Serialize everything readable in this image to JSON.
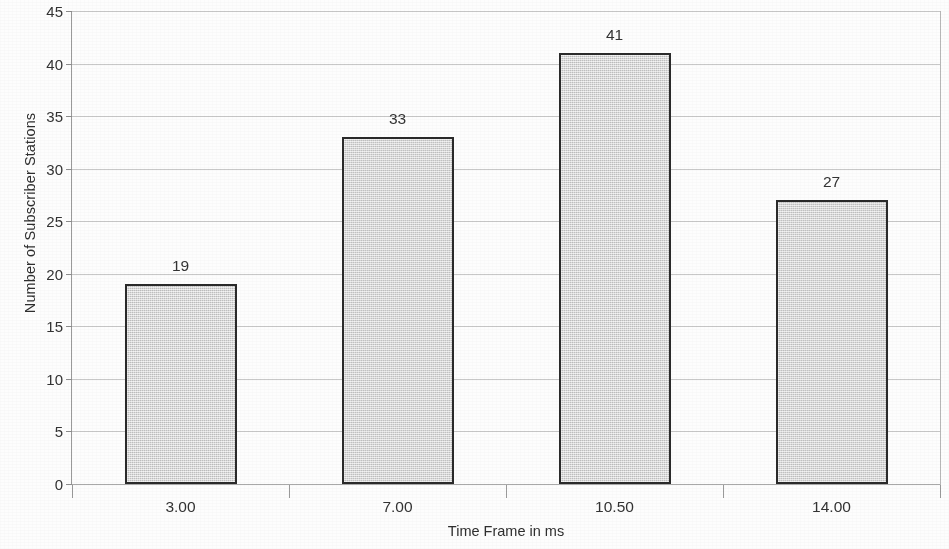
{
  "chart_data": {
    "type": "bar",
    "title": "",
    "categories": [
      "3.00",
      "7.00",
      "10.50",
      "14.00"
    ],
    "values": [
      19,
      33,
      41,
      27
    ],
    "xlabel": "Time Frame in ms",
    "ylabel": "Number of Subscriber Stations",
    "ylim": [
      0,
      45
    ],
    "ytick_labels": [
      "0",
      "5",
      "10",
      "15",
      "20",
      "25",
      "30",
      "35",
      "40",
      "45"
    ],
    "ytick_values": [
      0,
      5,
      10,
      15,
      20,
      25,
      30,
      35,
      40,
      45
    ],
    "grid": true,
    "legend": null,
    "bar_fill_color": "#d6d6d6",
    "bar_edge_color": "#2a2a2a",
    "grid_color": "#c8c8c8",
    "text_color": "#333333",
    "background_color": "#fdfdfd",
    "data_labels": [
      "19",
      "33",
      "41",
      "27"
    ]
  }
}
